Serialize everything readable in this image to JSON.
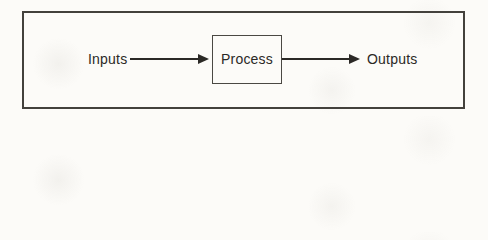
{
  "diagram": {
    "inputs_label": "Inputs",
    "process_label": "Process",
    "outputs_label": "Outputs",
    "edges": [
      {
        "from": "Inputs",
        "to": "Process"
      },
      {
        "from": "Process",
        "to": "Outputs"
      }
    ],
    "colors": {
      "line": "#2b2926",
      "frame_border": "#43413c",
      "process_border": "#4a4843",
      "background": "#fcfbf8"
    }
  }
}
